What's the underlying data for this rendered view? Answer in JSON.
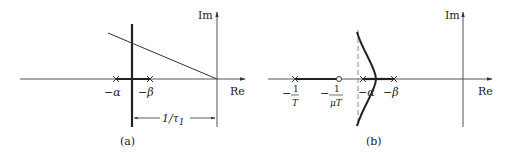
{
  "panel_a": {
    "caption": "(a)",
    "axis_re": "Re",
    "axis_im": "Im",
    "pole1_label": "−α",
    "pole2_label": "−β",
    "dimension_label": "1/τ",
    "dimension_sub": "1"
  },
  "panel_b": {
    "caption": "(b)",
    "axis_re": "Re",
    "axis_im": "Im",
    "pole_T_minus": "−",
    "pole_T_num": "1",
    "pole_T_den": "T",
    "zero_minus": "−",
    "zero_num": "1",
    "zero_den": "μT",
    "pole1_label": "−α",
    "pole2_label": "−β"
  },
  "colors": {
    "line": "#222222",
    "axis": "#555555",
    "dashed": "#888888"
  }
}
